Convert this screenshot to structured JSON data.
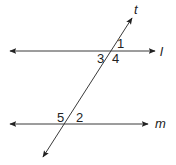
{
  "diagram": {
    "type": "parallel lines cut by a transversal",
    "background": "#ffffff",
    "line_color": "#3a3a3a",
    "lines": [
      {
        "name": "l",
        "label": "l",
        "x1": 10,
        "y1": 51,
        "x2": 155,
        "y2": 51,
        "label_x": 160,
        "label_y": 56
      },
      {
        "name": "m",
        "label": "m",
        "x1": 10,
        "y1": 124,
        "x2": 148,
        "y2": 124,
        "label_x": 155,
        "label_y": 128
      },
      {
        "name": "t",
        "label": "t",
        "x1": 43,
        "y1": 157,
        "x2": 132,
        "y2": 18,
        "label_x": 134,
        "label_y": 14
      }
    ],
    "angles": [
      {
        "label": "1",
        "x": 117,
        "y": 48
      },
      {
        "label": "3",
        "x": 97,
        "y": 63
      },
      {
        "label": "4",
        "x": 112,
        "y": 63
      },
      {
        "label": "5",
        "x": 57,
        "y": 122
      },
      {
        "label": "2",
        "x": 76,
        "y": 122
      }
    ]
  }
}
